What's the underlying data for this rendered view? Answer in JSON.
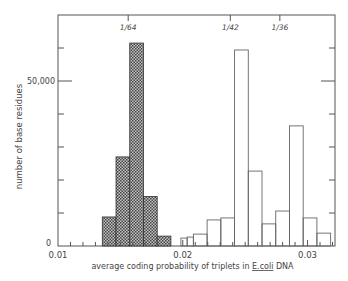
{
  "chart_data": {
    "type": "bar",
    "title": "",
    "xlabel": "average coding probability of triplets in E.coli DNA",
    "xlabel_parts": {
      "pre": "average coding probability of triplets in ",
      "underlined": "E.coli",
      "post": " DNA"
    },
    "ylabel": "number of base residues",
    "xlim": [
      0.01,
      0.0322
    ],
    "ylim": [
      0,
      70000
    ],
    "x_ticks": [
      {
        "value": 0.01,
        "label": "0.01"
      },
      {
        "value": 0.02,
        "label": "0.02"
      },
      {
        "value": 0.03,
        "label": "0.03"
      }
    ],
    "y_ticks": [
      {
        "value": 0,
        "label": "0"
      },
      {
        "value": 50000,
        "label": "50,000"
      }
    ],
    "y_minor_step": 10000,
    "x_minor_step": 0.001,
    "top_markers": [
      {
        "value": 0.015625,
        "label": "1/64"
      },
      {
        "value": 0.02381,
        "label": "1/42"
      },
      {
        "value": 0.02778,
        "label": "1/36"
      }
    ],
    "grid": false,
    "legend": null,
    "series": [
      {
        "name": "hatched (left distribution)",
        "style": "crosshatch",
        "bins": [
          {
            "x0": 0.01355,
            "x1": 0.01465,
            "value": 8800
          },
          {
            "x0": 0.01465,
            "x1": 0.01575,
            "value": 27000
          },
          {
            "x0": 0.01575,
            "x1": 0.01685,
            "value": 61500
          },
          {
            "x0": 0.01685,
            "x1": 0.01795,
            "value": 15000
          },
          {
            "x0": 0.01795,
            "x1": 0.01905,
            "value": 3000
          }
        ]
      },
      {
        "name": "open (right distribution)",
        "style": "open",
        "bins": [
          {
            "x0": 0.01985,
            "x1": 0.02035,
            "value": 2400
          },
          {
            "x0": 0.02035,
            "x1": 0.02085,
            "value": 2700
          },
          {
            "x0": 0.02085,
            "x1": 0.02195,
            "value": 3600
          },
          {
            "x0": 0.02195,
            "x1": 0.02305,
            "value": 7900
          },
          {
            "x0": 0.02305,
            "x1": 0.02415,
            "value": 8500
          },
          {
            "x0": 0.02415,
            "x1": 0.02525,
            "value": 59400
          },
          {
            "x0": 0.02525,
            "x1": 0.02635,
            "value": 22700
          },
          {
            "x0": 0.02635,
            "x1": 0.02745,
            "value": 6700
          },
          {
            "x0": 0.02745,
            "x1": 0.02855,
            "value": 10600
          },
          {
            "x0": 0.02855,
            "x1": 0.02965,
            "value": 36400
          },
          {
            "x0": 0.02965,
            "x1": 0.03075,
            "value": 8500
          },
          {
            "x0": 0.03075,
            "x1": 0.03185,
            "value": 3900
          }
        ]
      }
    ]
  },
  "colors": {
    "axis": "#555555",
    "hatch_fill": "#555555",
    "hatch_bg": "#bdbdbd",
    "open_stroke": "#666666",
    "text": "#444444"
  }
}
